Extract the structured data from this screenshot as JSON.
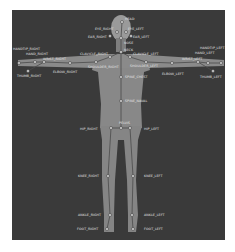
{
  "figure": {
    "background": "#3a3a3a",
    "body_color": "#8a8a8a",
    "bone_color": "#4a4a4a",
    "joint_fill": "#d0d0d0"
  },
  "joints": [
    {
      "id": "head",
      "label": "HEAD",
      "x": 122,
      "y": 22,
      "lx": 125,
      "ly": 20
    },
    {
      "id": "eye_right",
      "label": "EYE_RIGHT",
      "x": 117,
      "y": 32,
      "lx": 95,
      "ly": 30
    },
    {
      "id": "eye_left",
      "label": "EYE_LEFT",
      "x": 126,
      "y": 32,
      "lx": 128,
      "ly": 30
    },
    {
      "id": "ear_right",
      "label": "EAR_RIGHT",
      "x": 110,
      "y": 36,
      "lx": 88,
      "ly": 38
    },
    {
      "id": "ear_left",
      "label": "EAR_LEFT",
      "x": 131,
      "y": 36,
      "lx": 133,
      "ly": 38
    },
    {
      "id": "nose",
      "label": "NOSE",
      "x": 121,
      "y": 38,
      "lx": 124,
      "ly": 44
    },
    {
      "id": "neck",
      "label": "NECK",
      "x": 121,
      "y": 52,
      "lx": 124,
      "ly": 51
    },
    {
      "id": "clavicle_right",
      "label": "CLAVICLE_RIGHT",
      "x": 110,
      "y": 57,
      "lx": 80,
      "ly": 55
    },
    {
      "id": "clavicle_left",
      "label": "CLAVICLE_LEFT",
      "x": 130,
      "y": 57,
      "lx": 133,
      "ly": 55
    },
    {
      "id": "shoulder_right",
      "label": "SHOULDER_RIGHT",
      "x": 96,
      "y": 62,
      "lx": 88,
      "ly": 68
    },
    {
      "id": "shoulder_left",
      "label": "SHOULDER_LEFT",
      "x": 146,
      "y": 62,
      "lx": 130,
      "ly": 67
    },
    {
      "id": "elbow_right",
      "label": "ELBOW_RIGHT",
      "x": 70,
      "y": 63,
      "lx": 53,
      "ly": 73
    },
    {
      "id": "elbow_left",
      "label": "ELBOW_LEFT",
      "x": 172,
      "y": 63,
      "lx": 162,
      "ly": 75
    },
    {
      "id": "wrist_right",
      "label": "WRIST_RIGHT",
      "x": 44,
      "y": 62,
      "lx": 43,
      "ly": 60
    },
    {
      "id": "wrist_left",
      "label": "WRIST_LEFT",
      "x": 198,
      "y": 62,
      "lx": 182,
      "ly": 60
    },
    {
      "id": "hand_right",
      "label": "HAND_RIGHT",
      "x": 35,
      "y": 62,
      "lx": 26,
      "ly": 55
    },
    {
      "id": "hand_left",
      "label": "HAND_LEFT",
      "x": 208,
      "y": 63,
      "lx": 195,
      "ly": 54
    },
    {
      "id": "handtip_right",
      "label": "HANDTIP_RIGHT",
      "x": 19,
      "y": 63,
      "lx": 13,
      "ly": 50
    },
    {
      "id": "handtip_left",
      "label": "HANDTIP_LEFT",
      "x": 221,
      "y": 63,
      "lx": 200,
      "ly": 49
    },
    {
      "id": "thumb_right",
      "label": "THUMB_RIGHT",
      "x": 28,
      "y": 71,
      "lx": 17,
      "ly": 77
    },
    {
      "id": "thumb_left",
      "label": "THUMB_LEFT",
      "x": 213,
      "y": 71,
      "lx": 200,
      "ly": 78
    },
    {
      "id": "spine_chest",
      "label": "SPINE_CHEST",
      "x": 121,
      "y": 77,
      "lx": 125,
      "ly": 78
    },
    {
      "id": "spine_naval",
      "label": "SPINE_NAVAL",
      "x": 121,
      "y": 101,
      "lx": 125,
      "ly": 102
    },
    {
      "id": "pelvis",
      "label": "PELVIS",
      "x": 121,
      "y": 128,
      "lx": 119,
      "ly": 124
    },
    {
      "id": "hip_right",
      "label": "HIP_RIGHT",
      "x": 111,
      "y": 128,
      "lx": 80,
      "ly": 130
    },
    {
      "id": "hip_left",
      "label": "HIP_LEFT",
      "x": 130,
      "y": 128,
      "lx": 144,
      "ly": 130
    },
    {
      "id": "knee_right",
      "label": "KNEE_RIGHT",
      "x": 108,
      "y": 176,
      "lx": 78,
      "ly": 177
    },
    {
      "id": "knee_left",
      "label": "KNEE_LEFT",
      "x": 133,
      "y": 176,
      "lx": 144,
      "ly": 177
    },
    {
      "id": "ankle_right",
      "label": "ANKLE_RIGHT",
      "x": 110,
      "y": 215,
      "lx": 78,
      "ly": 216
    },
    {
      "id": "ankle_left",
      "label": "ANKLE_LEFT",
      "x": 132,
      "y": 215,
      "lx": 144,
      "ly": 216
    },
    {
      "id": "foot_right",
      "label": "FOOT_RIGHT",
      "x": 107,
      "y": 229,
      "lx": 77,
      "ly": 230
    },
    {
      "id": "foot_left",
      "label": "FOOT_LEFT",
      "x": 133,
      "y": 229,
      "lx": 144,
      "ly": 230
    }
  ],
  "bones": [
    [
      "head",
      "nose"
    ],
    [
      "nose",
      "neck"
    ],
    [
      "neck",
      "clavicle_right"
    ],
    [
      "neck",
      "clavicle_left"
    ],
    [
      "clavicle_right",
      "shoulder_right"
    ],
    [
      "clavicle_left",
      "shoulder_left"
    ],
    [
      "shoulder_right",
      "elbow_right"
    ],
    [
      "shoulder_left",
      "elbow_left"
    ],
    [
      "elbow_right",
      "wrist_right"
    ],
    [
      "elbow_left",
      "wrist_left"
    ],
    [
      "wrist_right",
      "hand_right"
    ],
    [
      "wrist_left",
      "hand_left"
    ],
    [
      "hand_right",
      "handtip_right"
    ],
    [
      "hand_left",
      "handtip_left"
    ],
    [
      "wrist_right",
      "thumb_right"
    ],
    [
      "wrist_left",
      "thumb_left"
    ],
    [
      "neck",
      "spine_chest"
    ],
    [
      "spine_chest",
      "spine_naval"
    ],
    [
      "spine_naval",
      "pelvis"
    ],
    [
      "pelvis",
      "hip_right"
    ],
    [
      "pelvis",
      "hip_left"
    ],
    [
      "hip_right",
      "knee_right"
    ],
    [
      "hip_left",
      "knee_left"
    ],
    [
      "knee_right",
      "ankle_right"
    ],
    [
      "knee_left",
      "ankle_left"
    ],
    [
      "ankle_right",
      "foot_right"
    ],
    [
      "ankle_left",
      "foot_left"
    ]
  ]
}
